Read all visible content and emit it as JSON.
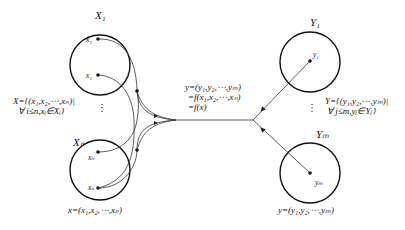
{
  "diagram": {
    "type": "mapping",
    "input_sets": [
      {
        "label": "X₁",
        "elements": [
          "x₁",
          "x₁"
        ]
      },
      {
        "label": "Xₙ",
        "elements": [
          "xₙ",
          "xₙ"
        ]
      }
    ],
    "output_sets": [
      {
        "label": "Y₁",
        "elements": [
          "y₁"
        ]
      },
      {
        "label": "Yₘ",
        "elements": [
          "yₘ"
        ]
      }
    ],
    "labels": {
      "X1": "X₁",
      "Xn": "Xₙ",
      "Y1": "Y₁",
      "Ym": "Yₘ",
      "x1a": "x₁",
      "x1b": "x₁",
      "xna": "xₙ",
      "xnb": "xₙ",
      "y1": "y₁",
      "ym": "yₘ",
      "dots_left": "⋮",
      "dots_right": "⋮"
    },
    "X_def": {
      "line1": "X={(x₁,x₂,⋯,xₙ)|",
      "line2": "∀ i≤n,xᵢ∈Xᵢ}"
    },
    "Y_def": {
      "line1": "Y={(y₁,y₂,⋯,yₘ)|",
      "line2": "∀ j≤m,yⱼ∈Yⱼ}"
    },
    "center": {
      "line1": "y=(y₁,y₂,⋯,yₘ)",
      "line2": "=f(x₁,x₂,⋯,xₙ)",
      "line3": "=f(x)"
    },
    "x_tuple": "x=(x₁,x₂,⋯,xₙ)",
    "y_tuple": "y=(y₁,y₂,⋯,yₘ)",
    "caption": ""
  }
}
